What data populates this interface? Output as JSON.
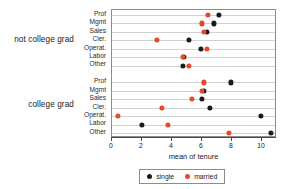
{
  "chart_data": {
    "type": "scatter",
    "title": "",
    "xlabel": "mean of tenure",
    "ylabel": "",
    "xlim": [
      0,
      11
    ],
    "xticks": [
      0,
      2,
      4,
      6,
      8,
      10
    ],
    "xtick_labels": [
      "0",
      "2",
      "4",
      "6",
      "8",
      "10"
    ],
    "grid": true,
    "legend_position": "bottom",
    "legend": [
      {
        "name": "single",
        "color": "#1b1b1b"
      },
      {
        "name": "married",
        "color": "#e8472b"
      }
    ],
    "groups": [
      {
        "label": "not college grad",
        "categories": [
          "Prof",
          "Mgmt",
          "Sales",
          "Cler.",
          "Operat.",
          "Labor",
          "Other"
        ],
        "series": [
          {
            "name": "single",
            "color": "#1b1b1b",
            "values": [
              7.1,
              6.8,
              6.3,
              5.1,
              5.9,
              4.8,
              4.7
            ]
          },
          {
            "name": "married",
            "color": "#e8472b",
            "values": [
              6.4,
              6.0,
              6.1,
              3.0,
              6.3,
              4.7,
              5.1
            ]
          }
        ]
      },
      {
        "label": "college grad",
        "categories": [
          "Prof",
          "Mgmt",
          "Sales",
          "Cler.",
          "Operat.",
          "Labor",
          "Other"
        ],
        "series": [
          {
            "name": "single",
            "color": "#1b1b1b",
            "values": [
              7.9,
              6.1,
              6.0,
              6.5,
              9.9,
              2.0,
              10.6
            ]
          },
          {
            "name": "married",
            "color": "#e8472b",
            "values": [
              6.1,
              6.0,
              5.3,
              3.3,
              0.4,
              3.7,
              7.8
            ]
          }
        ]
      }
    ]
  }
}
